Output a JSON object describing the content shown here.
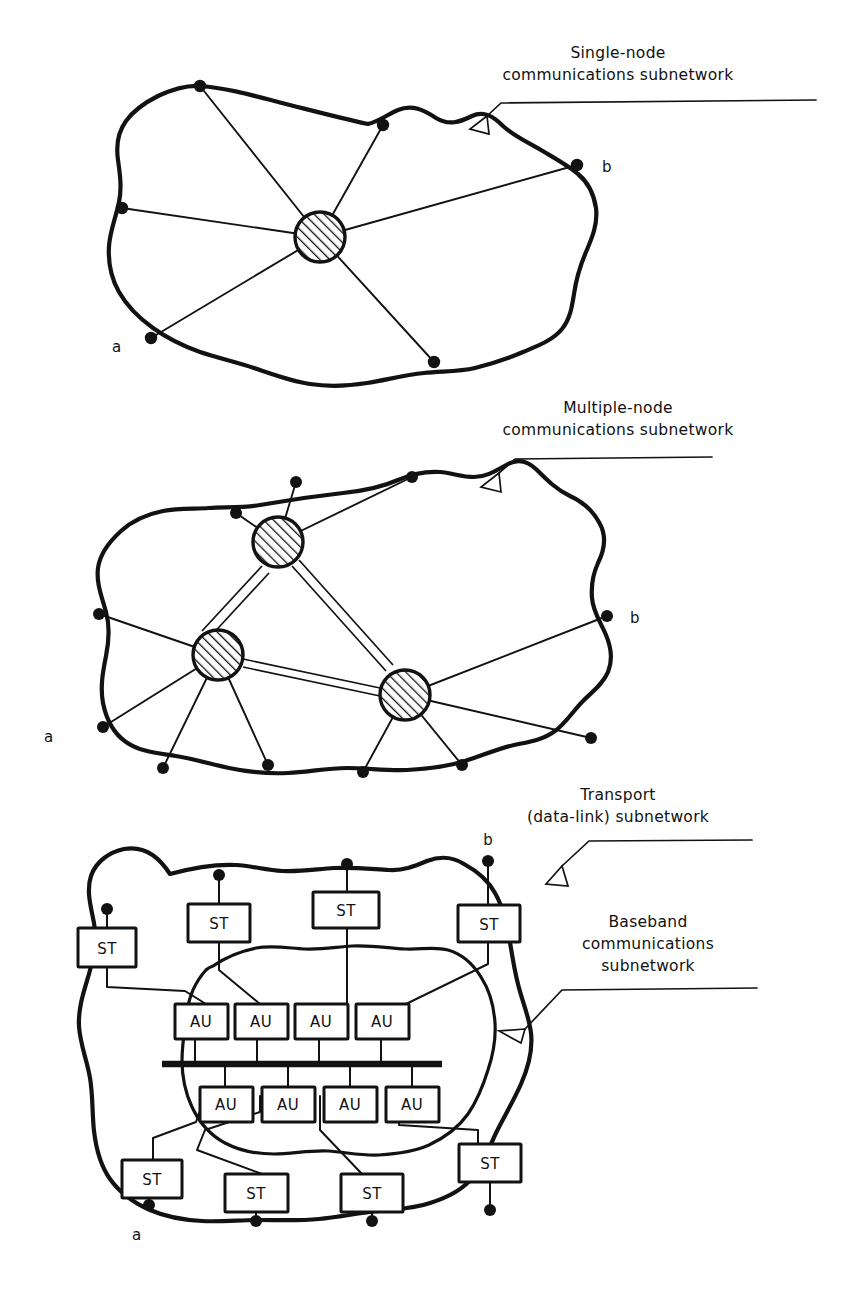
{
  "figure": {
    "type": "network-topology-diagram",
    "panel_count": 3
  },
  "colors": {
    "ink": "#121212",
    "paper": "#ffffff",
    "hatch": "#121212"
  },
  "panels": [
    {
      "id": "panel-single-node",
      "caption_lines": [
        "Single-node",
        "communications subnetwork"
      ],
      "caption_full": "Single-node communications subnetwork",
      "endpoint_labels": {
        "a": "a",
        "b": "b"
      },
      "central_nodes": 1,
      "boundary_nodes": 6,
      "node_style": "hatched-circle"
    },
    {
      "id": "panel-multiple-node",
      "caption_lines": [
        "Multiple-node",
        "communications subnetwork"
      ],
      "caption_full": "Multiple-node communications subnetwork",
      "endpoint_labels": {
        "a": "a",
        "b": "b"
      },
      "central_nodes": 3,
      "boundary_nodes": 11,
      "node_style": "hatched-circle",
      "internode_links": "double-line trunk"
    },
    {
      "id": "panel-transport",
      "caption_lines": [
        "Transport",
        "(data-link) subnetwork"
      ],
      "caption_full": "Transport (data-link) subnetwork",
      "inner_caption_lines": [
        "Baseband",
        "communications",
        "subnetwork"
      ],
      "inner_caption_full": "Baseband communications subnetwork",
      "endpoint_labels": {
        "a": "a",
        "b": "b"
      },
      "boundary_nodes": 8,
      "st_boxes": [
        {
          "label": "ST",
          "position": "upper-left-outer"
        },
        {
          "label": "ST",
          "position": "upper-left"
        },
        {
          "label": "ST",
          "position": "upper-center"
        },
        {
          "label": "ST",
          "position": "upper-right"
        },
        {
          "label": "ST",
          "position": "lower-left"
        },
        {
          "label": "ST",
          "position": "lower-center-left"
        },
        {
          "label": "ST",
          "position": "lower-center-right"
        },
        {
          "label": "ST",
          "position": "lower-right-outer"
        }
      ],
      "au_boxes_top": [
        {
          "label": "AU"
        },
        {
          "label": "AU"
        },
        {
          "label": "AU"
        },
        {
          "label": "AU"
        }
      ],
      "au_boxes_bottom": [
        {
          "label": "AU"
        },
        {
          "label": "AU"
        },
        {
          "label": "AU"
        },
        {
          "label": "AU"
        }
      ],
      "bus": {
        "style": "thick-horizontal-bar",
        "taps": 8
      }
    }
  ],
  "glossary": {
    "ST": "ST",
    "AU": "AU"
  }
}
